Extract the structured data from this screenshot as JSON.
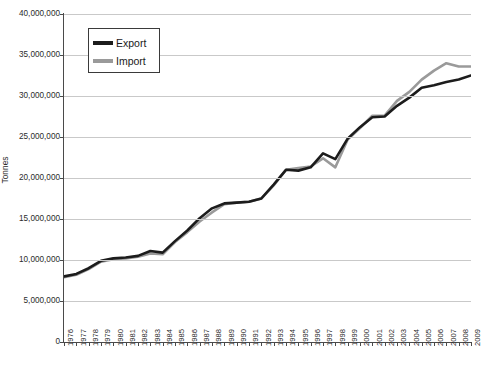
{
  "chart_data": {
    "type": "line",
    "title": "",
    "xlabel": "",
    "ylabel": "Tonnes",
    "ylim": [
      0,
      40000000
    ],
    "grid": true,
    "legend_position": "upper-left-inside",
    "y_ticks": [
      "0",
      "5,000,000",
      "10,000,000",
      "15,000,000",
      "20,000,000",
      "25,000,000",
      "30,000,000",
      "35,000,000",
      "40,000,000"
    ],
    "y_tick_values": [
      0,
      5000000,
      10000000,
      15000000,
      20000000,
      25000000,
      30000000,
      35000000,
      40000000
    ],
    "categories": [
      "1976",
      "1977",
      "1978",
      "1979",
      "1980",
      "1981",
      "1982",
      "1983",
      "1984",
      "1985",
      "1986",
      "1987",
      "1988",
      "1989",
      "1990",
      "1991",
      "1992",
      "1993",
      "1994",
      "1995",
      "1996",
      "1997",
      "1998",
      "1999",
      "2000",
      "2001",
      "2002",
      "2003",
      "2004",
      "2005",
      "2006",
      "2007",
      "2008",
      "2009"
    ],
    "series": [
      {
        "name": "Export",
        "color": "#1c1c1c",
        "values": [
          8000000,
          8300000,
          9000000,
          9900000,
          10200000,
          10300000,
          10500000,
          11100000,
          10900000,
          12300000,
          13600000,
          15100000,
          16300000,
          16900000,
          17000000,
          17100000,
          17500000,
          19200000,
          21000000,
          20900000,
          21300000,
          23000000,
          22300000,
          24800000,
          26200000,
          27400000,
          27500000,
          28800000,
          29800000,
          31000000,
          31300000,
          31700000,
          32000000,
          32500000
        ]
      },
      {
        "name": "Import",
        "color": "#9a9a9a",
        "values": [
          7900000,
          8200000,
          8900000,
          9800000,
          10100000,
          10200000,
          10400000,
          10800000,
          10700000,
          12200000,
          13400000,
          14700000,
          15800000,
          16800000,
          17000000,
          17100000,
          17500000,
          19100000,
          21000000,
          21200000,
          21400000,
          22400000,
          21300000,
          24700000,
          26100000,
          27600000,
          27600000,
          29400000,
          30500000,
          32000000,
          33100000,
          34000000,
          33600000,
          33600000
        ]
      }
    ]
  },
  "legend": {
    "items": [
      {
        "label": "Export",
        "color": "#1c1c1c"
      },
      {
        "label": "Import",
        "color": "#9a9a9a"
      }
    ]
  },
  "axes": {
    "y_title": "Tonnes"
  }
}
